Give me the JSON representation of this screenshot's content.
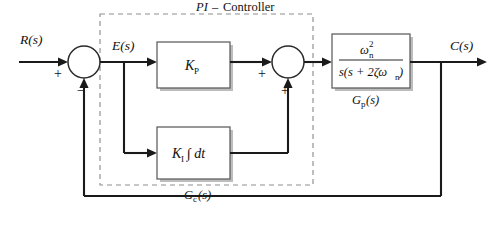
{
  "diagram": {
    "type": "control-system-block-diagram",
    "signals": {
      "input": "R(s)",
      "error": "E(s)",
      "output": "C(s)"
    },
    "controller_group": {
      "title_italic": "PI",
      "title_dash": "–",
      "title_roman": "Controller",
      "under_label_base": "G",
      "under_label_sub": "c",
      "under_label_tail": "(s)"
    },
    "blocks": [
      {
        "id": "proportional",
        "label_base": "K",
        "label_sub": "P"
      },
      {
        "id": "integral",
        "label_base": "K",
        "label_sub": "I",
        "label_tail": "∫ dt"
      },
      {
        "id": "plant",
        "numerator_base": "ω",
        "numerator_sub": "n",
        "numerator_sup": "2",
        "denominator": "s(s + 2ζω",
        "denominator_sub": "n",
        "denominator_tail": ")",
        "under_label_base": "G",
        "under_label_sub": "p",
        "under_label_tail": "(s)"
      }
    ],
    "summing_junctions": [
      {
        "id": "error-summer",
        "input_sign": "+",
        "feedback_sign": "−"
      },
      {
        "id": "controller-summer",
        "input_sign": "+",
        "feedback_sign": "+"
      }
    ],
    "colors": {
      "wire": "#1a1a1a",
      "block_border": "#5b5b5b",
      "dashed_border": "#8d8d8d",
      "background": "#ffffff",
      "text": "#101010"
    }
  }
}
